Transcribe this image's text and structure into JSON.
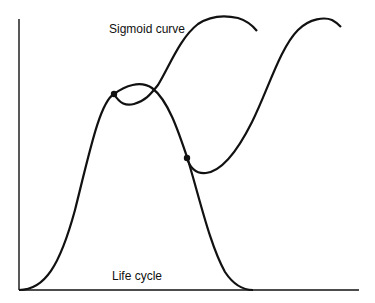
{
  "diagram": {
    "labels": {
      "sigmoid": "Sigmoid curve",
      "life_cycle": "Life cycle"
    },
    "colors": {
      "line": "#111111",
      "background": "#ffffff"
    },
    "elements": [
      "y-axis",
      "x-axis",
      "life-cycle-bell-curve",
      "first-sigmoid-curve",
      "second-sigmoid-curve",
      "branch-point-1",
      "branch-point-2"
    ]
  }
}
